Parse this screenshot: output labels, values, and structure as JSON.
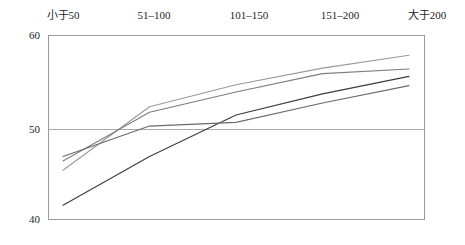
{
  "chart_data": {
    "type": "line",
    "title": "",
    "subtitle": "",
    "xlabel": "",
    "ylabel": "",
    "categories": [
      "小于50",
      "51–100",
      "101–150",
      "151–200",
      "大于200"
    ],
    "ylim": [
      40,
      60
    ],
    "yticks": [
      40,
      50,
      60
    ],
    "ytick_labels": [
      "40",
      "50",
      "60"
    ],
    "grid": "horizontal-at-50",
    "legend": "none",
    "xtick_position": "top",
    "series": [
      {
        "name": "series-1",
        "color": "#9a9a9a",
        "values": [
          45.3,
          52.2,
          54.6,
          56.4,
          57.8
        ]
      },
      {
        "name": "series-2",
        "color": "#7d7d7d",
        "values": [
          46.3,
          51.6,
          53.8,
          55.8,
          56.3
        ]
      },
      {
        "name": "series-3",
        "color": "#3b3b3b",
        "values": [
          41.5,
          46.8,
          51.3,
          53.6,
          55.5
        ]
      },
      {
        "name": "series-4",
        "color": "#6a6a6a",
        "values": [
          46.8,
          50.1,
          50.5,
          52.6,
          54.5
        ]
      }
    ]
  },
  "axis": {
    "y_top_label": "60",
    "y_mid_label": "50",
    "y_bottom_label": "40"
  },
  "colors": {
    "frame": "#9a9a9a",
    "gridline": "#a9a9a9",
    "text": "#1d1d1d",
    "background": "#ffffff"
  }
}
